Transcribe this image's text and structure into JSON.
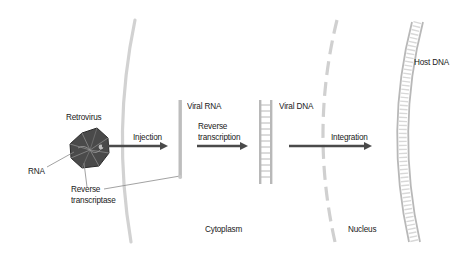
{
  "diagram": {
    "labels": {
      "retrovirus": "Retrovirus",
      "rna": "RNA",
      "reverse_transcriptase_line1": "Reverse",
      "reverse_transcriptase_line2": "transcriptase",
      "injection": "Injection",
      "viral_rna": "Viral RNA",
      "reverse_transcription_line1": "Reverse",
      "reverse_transcription_line2": "transcription",
      "viral_dna": "Viral DNA",
      "integration": "Integration",
      "host_dna": "Host DNA",
      "cytoplasm": "Cytoplasm",
      "nucleus": "Nucleus"
    },
    "colors": {
      "arrow": "#4a4a4a",
      "membrane": "#d2d2d2",
      "nuclear_envelope": "#d0d0d0",
      "strand": "#bdbdbd",
      "virus_dark": "#3a3a3a",
      "leader_line": "#8a8a8a",
      "text": "#1a1a1a"
    },
    "steps": [
      "Injection",
      "Reverse transcription",
      "Integration"
    ]
  }
}
